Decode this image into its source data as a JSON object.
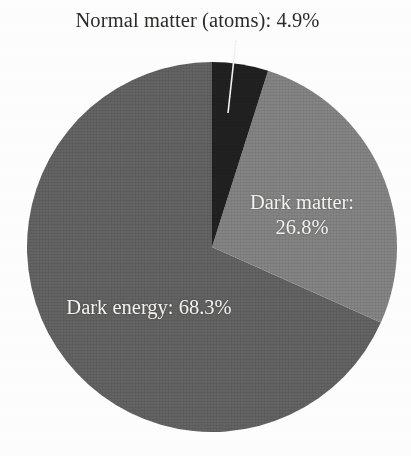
{
  "figure": {
    "background_color": "#fdfdfd",
    "external_label": "Normal matter (atoms): 4.9%",
    "external_label_color": "#2b2a28",
    "leader_line_color": "#f2f2f0"
  },
  "chart_data": {
    "type": "pie",
    "title": "",
    "subtitle": "",
    "xlabel": "",
    "ylabel": "",
    "grid": false,
    "legend_position": "none",
    "units": "percent",
    "total": 100.0,
    "start_angle_deg": 0,
    "direction": "clockwise",
    "center_px": [
      212,
      247
    ],
    "radius_px": 185,
    "categories": [
      "Normal matter (atoms)",
      "Dark matter",
      "Dark energy"
    ],
    "values": [
      4.9,
      26.8,
      68.3
    ],
    "slices": [
      {
        "name": "Normal matter (atoms)",
        "value": 4.9,
        "value_text": "4.9%",
        "label_text": "Normal matter (atoms): 4.9%",
        "color": "#1f1f1f",
        "label_placement": "external-above",
        "start_deg": 0.0,
        "end_deg": 17.64
      },
      {
        "name": "Dark matter",
        "value": 26.8,
        "value_text": "26.8%",
        "label_line1": "Dark matter:",
        "label_line2": "26.8%",
        "color": "#7e7e7e",
        "label_placement": "inside",
        "start_deg": 17.64,
        "end_deg": 114.12
      },
      {
        "name": "Dark energy",
        "value": 68.3,
        "value_text": "68.3%",
        "label_line1": "Dark energy: 68.3%",
        "color": "#5e5e5e",
        "label_placement": "inside",
        "start_deg": 114.12,
        "end_deg": 360.0
      }
    ]
  }
}
